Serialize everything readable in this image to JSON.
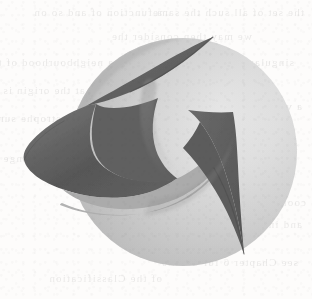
{
  "page": {
    "width": 312,
    "height": 299,
    "background_color": "#fdfcfb",
    "media": "scanned-book-page",
    "caption": ""
  },
  "figure": {
    "name": "cuspidal-surface-over-sphere",
    "colors": {
      "background": "#fdfcfb",
      "sphere_highlight": "#e4e4e4",
      "sphere_midtone": "#c9c9c9",
      "sphere_shadow": "#b4b4b4",
      "surface_dark": "#585858",
      "surface_mid": "#6e6e6e",
      "surface_light": "#8c8c8c",
      "fold_band": "#b0b0b0",
      "edge_line": "#4a4a4a"
    },
    "geometry": {
      "sphere_center_x": 183,
      "sphere_center_y": 152,
      "sphere_radius": 114,
      "upper_cusp_tip_x": 213,
      "upper_cusp_tip_y": 37,
      "lower_cusp_tip_x": 244,
      "lower_cusp_tip_y": 254,
      "left_lobe_tip_x": 24,
      "left_lobe_tip_y": 156
    }
  },
  "bleed_through": {
    "note": "illegible mirrored show-through from reverse page",
    "lines": [
      {
        "text": "the set of all such the same",
        "x": 8,
        "y": 6,
        "size": 11
      },
      {
        "text": "a function of and so on",
        "x": 150,
        "y": 6,
        "size": 11
      },
      {
        "text": "we may then consider the",
        "x": 60,
        "y": 30,
        "size": 11
      },
      {
        "text": "singular points of the map",
        "x": 18,
        "y": 56,
        "size": 11
      },
      {
        "text": "in a neighbourhood of the",
        "x": 184,
        "y": 56,
        "size": 11
      },
      {
        "text": "germ at the origin is given",
        "x": 196,
        "y": 84,
        "size": 11
      },
      {
        "text": "a versal unfolding of the",
        "x": 10,
        "y": 100,
        "size": 11
      },
      {
        "text": "cusp catastrophe surface",
        "x": 200,
        "y": 112,
        "size": 11
      },
      {
        "text": "is equivalent to the normal",
        "x": 14,
        "y": 140,
        "size": 11
      },
      {
        "text": "form under a change of",
        "x": 196,
        "y": 152,
        "size": 11
      },
      {
        "text": "coordinates in the source",
        "x": 6,
        "y": 196,
        "size": 11
      },
      {
        "text": "and in the target space",
        "x": 10,
        "y": 218,
        "size": 11
      },
      {
        "text": "see Chapter 6 for details",
        "x": 14,
        "y": 256,
        "size": 11
      },
      {
        "text": "of the Classification",
        "x": 150,
        "y": 272,
        "size": 11
      }
    ]
  }
}
